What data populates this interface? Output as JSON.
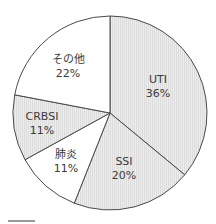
{
  "chart_data": {
    "type": "pie",
    "title": "",
    "start_angle_deg": 0,
    "direction": "clockwise",
    "center": [
      110,
      113
    ],
    "radius": 97,
    "stroke_color": "#4a4a4a",
    "slices": [
      {
        "label": "UTI",
        "value": 36,
        "value_label": "36%",
        "fill": "#e6e6e6",
        "pattern": "vertical-stripes",
        "label_pos": [
          158,
          83
        ]
      },
      {
        "label": "SSI",
        "value": 20,
        "value_label": "20%",
        "fill": "#e6e6e6",
        "pattern": "vertical-stripes",
        "label_pos": [
          124,
          165
        ]
      },
      {
        "label": "肺炎",
        "value": 11,
        "value_label": "11%",
        "fill": "#ffffff",
        "pattern": "none",
        "label_pos": [
          66,
          158
        ]
      },
      {
        "label": "CRBSI",
        "value": 11,
        "value_label": "11%",
        "fill": "#e6e6e6",
        "pattern": "vertical-stripes",
        "label_pos": [
          42,
          120
        ]
      },
      {
        "label": "その他",
        "value": 22,
        "value_label": "22%",
        "fill": "#ffffff",
        "pattern": "none",
        "label_pos": [
          68,
          63
        ]
      }
    ],
    "categories": [
      "UTI",
      "SSI",
      "肺炎",
      "CRBSI",
      "その他"
    ],
    "values": [
      36,
      20,
      11,
      11,
      22
    ]
  }
}
